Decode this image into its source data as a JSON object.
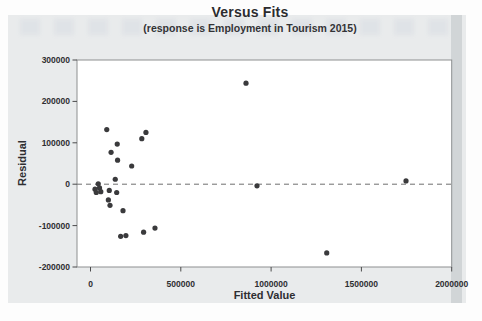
{
  "figure": {
    "title": "Versus Fits",
    "subtitle": "(response is Employment in Tourism 2015)"
  },
  "chart_data": {
    "type": "scatter",
    "title": "Versus Fits",
    "subtitle": "(response is Employment in Tourism 2015)",
    "xlabel": "Fitted Value",
    "ylabel": "Residual",
    "xlim": [
      0,
      2000000
    ],
    "ylim": [
      -200000,
      300000
    ],
    "x_ticks": [
      0,
      500000,
      1000000,
      1500000,
      2000000
    ],
    "y_ticks": [
      300000,
      200000,
      100000,
      0,
      -100000,
      -200000
    ],
    "grid": false,
    "legend": "none",
    "reference_line_y": 0,
    "reference_line_style": "dashed",
    "points": [
      [
        90000,
        132000
      ],
      [
        307000,
        125000
      ],
      [
        284000,
        110000
      ],
      [
        148000,
        97000
      ],
      [
        114000,
        77000
      ],
      [
        150000,
        58000
      ],
      [
        228000,
        44000
      ],
      [
        137000,
        12000
      ],
      [
        43000,
        1000
      ],
      [
        25000,
        -12000
      ],
      [
        50000,
        -9000
      ],
      [
        32000,
        -20000
      ],
      [
        57000,
        -18000
      ],
      [
        104000,
        -15000
      ],
      [
        145000,
        -20000
      ],
      [
        99000,
        -38000
      ],
      [
        108000,
        -51000
      ],
      [
        180000,
        -64000
      ],
      [
        167000,
        -126000
      ],
      [
        196000,
        -124000
      ],
      [
        294000,
        -116000
      ],
      [
        357000,
        -106000
      ],
      [
        861000,
        244000
      ],
      [
        922000,
        -4000
      ],
      [
        1308000,
        -166000
      ],
      [
        1747000,
        8000
      ]
    ],
    "colors": {
      "point": "#3a3a3c",
      "reference_line": "#6f6f6f",
      "frame": "#8d8f90",
      "tick": "#4a4a4c",
      "text": "#2e2e31",
      "figure_bg": "#e9ebec",
      "plot_bg": "#ffffff"
    }
  }
}
